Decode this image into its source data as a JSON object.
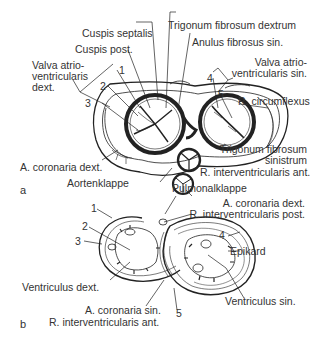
{
  "figure": {
    "panel_a": {
      "letter": "a",
      "labels": {
        "cuspis_septalis": "Cuspis septalis",
        "cuspis_post": "Cuspis post.",
        "valva_av_dext_1": "Valva atrio-",
        "valva_av_dext_2": "ventricularis",
        "valva_av_dext_3": "dext.",
        "trigonum_dextrum": "Trigonum fibrosum dextrum",
        "anulus_sin": "Anulus fibrosus sin.",
        "valva_av_sin_1": "Valva atrio-",
        "valva_av_sin_2": "ventricularis sin.",
        "r_circumflexus": "R. circumflexus",
        "a_coronaria_dext": "A. coronaria dext.",
        "trigonum_sinistrum_1": "Trigonum fibrosum",
        "trigonum_sinistrum_2": "sinistrum",
        "r_interventricularis_ant": "R. interventricularis ant.",
        "aortenklappe": "Aortenklappe",
        "pulmonalklappe": "Pulmonalklappe"
      },
      "numbers": [
        "1",
        "2",
        "3",
        "4",
        "5"
      ]
    },
    "panel_b": {
      "letter": "b",
      "labels": {
        "a_coronaria_dext": "A. coronaria dext.",
        "r_interventricularis_post": "R. interventricularis post.",
        "epikard": "Epikard",
        "ventriculus_dext": "Ventriculus dext.",
        "ventriculus_sin": "Ventriculus sin.",
        "a_coronaria_sin": "A. coronaria sin.",
        "r_interventricularis_ant": "R. interventricularis ant."
      },
      "numbers": [
        "1",
        "2",
        "3",
        "4",
        "5"
      ]
    }
  }
}
